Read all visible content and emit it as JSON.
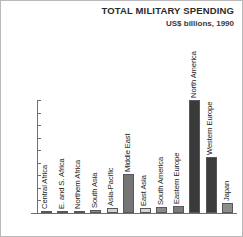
{
  "chart_data": {
    "type": "bar",
    "title": "TOTAL MILITARY SPENDING",
    "subtitle": "US$ billions, 1990",
    "xlabel": "",
    "ylabel": "",
    "ylim": [
      0,
      450
    ],
    "ytick_step": 50,
    "yticks": [
      450,
      400,
      350,
      300,
      250,
      200,
      150,
      100,
      50,
      0
    ],
    "grid": false,
    "legend": "none",
    "orientation": "vertical",
    "categories": [
      "Central Africa",
      "E. and S. Africa",
      "Northern Africa",
      "South Asia",
      "Asia-Pacific",
      "Middle East",
      "East Asia",
      "South America",
      "Eastern Europe",
      "North America",
      "Western Europe",
      "Japan"
    ],
    "values": [
      3,
      6,
      8,
      14,
      20,
      155,
      20,
      22,
      26,
      450,
      222,
      40
    ],
    "bar_colors": [
      "#8e8e8e",
      "#6e6e6e",
      "#9a9a9a",
      "#8c8c8c",
      "#d2d2d2",
      "#757575",
      "#d7d7d7",
      "#8a8a8a",
      "#7b7b7b",
      "#3a3a3a",
      "#3c3c3c",
      "#8d8d8d"
    ]
  },
  "colors": {
    "axis": "#6f6f6f",
    "title_text": "#2b2b2b",
    "tick_text": "#4a4a4a",
    "label_text": "#1d1d1d",
    "background": "#ffffff",
    "frame": "#b9b9b9"
  }
}
